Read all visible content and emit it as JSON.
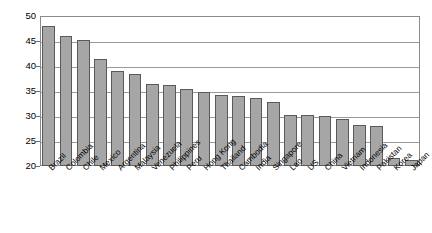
{
  "chart_data": {
    "type": "bar",
    "title": "",
    "subtitle": "",
    "xlabel": "",
    "ylabel": "",
    "ylim": [
      20,
      50
    ],
    "ytick_step": 5,
    "yticks": [
      20,
      25,
      30,
      35,
      40,
      45,
      50
    ],
    "ytick_labels": [
      "20",
      "25",
      "30",
      "35",
      "40",
      "45",
      "50"
    ],
    "grid": true,
    "grid_axis": "y",
    "legend": false,
    "legend_position": "none",
    "bar_color": "#a6a6a6",
    "bar_edge_color": "#5a5a5a",
    "frame_color": "#8a8a8a",
    "gridline_color": "#9a9a9a",
    "background_color": "#ffffff",
    "xtick_rotation": -45,
    "categories": [
      "Brazil",
      "Colombia",
      "Chile",
      "Mexico",
      "Argentina",
      "Malaysia",
      "Venezuela",
      "Philippines",
      "Peru",
      "Hong Kong",
      "Thailand",
      "Cambodia",
      "India",
      "Singapore",
      "Lao",
      "US",
      "China",
      "Vietnam",
      "Indonesia",
      "Pakistan",
      "Korea",
      "Japan"
    ],
    "values": [
      48.0,
      46.0,
      45.3,
      41.5,
      39.0,
      38.4,
      36.5,
      36.2,
      35.4,
      34.9,
      34.2,
      34.0,
      33.7,
      32.8,
      30.3,
      30.2,
      30.0,
      29.4,
      28.3,
      28.1,
      21.6,
      21.3
    ]
  }
}
